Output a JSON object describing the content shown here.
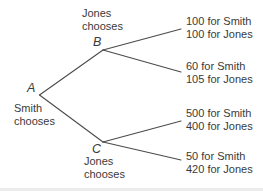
{
  "figure": {
    "type": "decision-tree",
    "colors": {
      "background": "#ffffff",
      "line": "#4b4b4b",
      "text": "#3a3a3a"
    },
    "root_node": {
      "label": "A",
      "caption": "Smith chooses"
    },
    "branch_nodes": [
      {
        "label": "B",
        "caption": "Jones chooses"
      },
      {
        "label": "C",
        "caption": "Jones chooses"
      }
    ],
    "outcomes": [
      {
        "smith": "100 for Smith",
        "jones": "100 for Jones"
      },
      {
        "smith": "60 for Smith",
        "jones": "105 for Jones"
      },
      {
        "smith": "500 for Smith",
        "jones": "400 for Jones"
      },
      {
        "smith": "50 for Smith",
        "jones": "420 for Jones"
      }
    ]
  }
}
